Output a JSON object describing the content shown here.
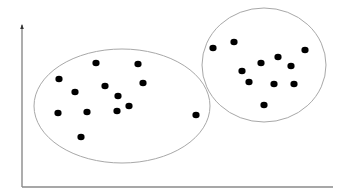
{
  "diagram": {
    "type": "cluster-scatter",
    "axes": {
      "origin": [
        22,
        187
      ],
      "y_top": [
        22,
        25
      ],
      "x_end": [
        333,
        187
      ],
      "color": "#8a8a8a"
    },
    "clusters": [
      {
        "name": "left-cluster",
        "ellipse": {
          "cx": 122,
          "cy": 106,
          "rx": 88,
          "ry": 57
        },
        "stroke": "#a8a8a8"
      },
      {
        "name": "right-cluster",
        "ellipse": {
          "cx": 264,
          "cy": 65,
          "rx": 62,
          "ry": 57
        },
        "stroke": "#a8a8a8"
      }
    ],
    "point_color": "#000000",
    "points": [
      {
        "x": 96,
        "y": 63,
        "cluster": "left"
      },
      {
        "x": 138,
        "y": 64,
        "cluster": "left"
      },
      {
        "x": 59,
        "y": 79,
        "cluster": "left"
      },
      {
        "x": 143,
        "y": 83,
        "cluster": "left"
      },
      {
        "x": 75,
        "y": 92,
        "cluster": "left"
      },
      {
        "x": 105,
        "y": 86,
        "cluster": "left"
      },
      {
        "x": 118,
        "y": 96,
        "cluster": "left"
      },
      {
        "x": 129,
        "y": 106,
        "cluster": "left"
      },
      {
        "x": 117,
        "y": 111,
        "cluster": "left"
      },
      {
        "x": 58,
        "y": 113,
        "cluster": "left"
      },
      {
        "x": 87,
        "y": 112,
        "cluster": "left"
      },
      {
        "x": 81,
        "y": 137,
        "cluster": "left"
      },
      {
        "x": 196,
        "y": 115,
        "cluster": "left"
      },
      {
        "x": 213,
        "y": 48,
        "cluster": "right"
      },
      {
        "x": 234,
        "y": 42,
        "cluster": "right"
      },
      {
        "x": 305,
        "y": 50,
        "cluster": "right"
      },
      {
        "x": 278,
        "y": 57,
        "cluster": "right"
      },
      {
        "x": 261,
        "y": 63,
        "cluster": "right"
      },
      {
        "x": 291,
        "y": 66,
        "cluster": "right"
      },
      {
        "x": 242,
        "y": 71,
        "cluster": "right"
      },
      {
        "x": 249,
        "y": 82,
        "cluster": "right"
      },
      {
        "x": 274,
        "y": 84,
        "cluster": "right"
      },
      {
        "x": 294,
        "y": 84,
        "cluster": "right"
      },
      {
        "x": 264,
        "y": 105,
        "cluster": "right"
      }
    ]
  }
}
